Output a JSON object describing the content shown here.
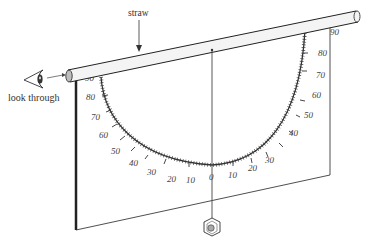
{
  "diagram": {
    "labels": {
      "straw": "straw",
      "look_through": "look through"
    },
    "scale": {
      "left_labels": [
        "90",
        "80",
        "70",
        "60",
        "50",
        "40",
        "30",
        "20",
        "10"
      ],
      "center_label": "0",
      "right_labels": [
        "10",
        "20",
        "30",
        "40",
        "50",
        "60",
        "70",
        "80",
        "90"
      ]
    },
    "components": [
      "eye",
      "straw",
      "board",
      "protractor-scale",
      "plumb-string",
      "hex-nut-weight"
    ],
    "colors": {
      "line": "#222222",
      "straw_fill": "#f4f4f4",
      "board_fill": "#ffffff",
      "nut_fill": "#cccccc"
    }
  }
}
